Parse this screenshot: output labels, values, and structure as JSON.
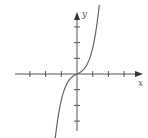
{
  "chart_data": {
    "type": "line",
    "title": "",
    "xlabel": "x",
    "ylabel": "y",
    "axis_color": "#555555",
    "curve_color": "#666666",
    "grid": false,
    "legend": null,
    "x_ticks_left": 3,
    "x_ticks_right": 3,
    "y_ticks_up": 3,
    "y_ticks_down": 3,
    "tick_labels": "none",
    "x": [
      -1.4,
      -1.2,
      -1.0,
      -0.6,
      -0.3,
      0,
      0.3,
      0.6,
      1.0,
      1.2,
      1.4
    ],
    "y": [
      -3.6,
      -2.6,
      -1.6,
      -0.6,
      -0.2,
      0,
      0.2,
      0.6,
      1.6,
      2.6,
      3.6
    ],
    "xlim": [
      -4,
      4.3
    ],
    "ylim": [
      -3.7,
      4
    ]
  }
}
